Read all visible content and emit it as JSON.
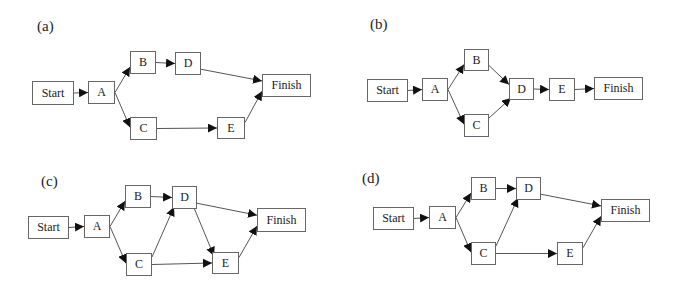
{
  "diagrams": [
    {
      "label": "(a)",
      "label_pos": [
        37,
        18
      ],
      "nodes": [
        {
          "id": "Start",
          "label": "Start",
          "x": 32,
          "y": 81,
          "w": 42,
          "h": 24
        },
        {
          "id": "A",
          "label": "A",
          "x": 88,
          "y": 81,
          "w": 27,
          "h": 23
        },
        {
          "id": "B",
          "label": "B",
          "x": 130,
          "y": 51,
          "w": 26,
          "h": 23
        },
        {
          "id": "D",
          "label": "D",
          "x": 175,
          "y": 52,
          "w": 26,
          "h": 23
        },
        {
          "id": "C",
          "label": "C",
          "x": 130,
          "y": 117,
          "w": 27,
          "h": 23
        },
        {
          "id": "E",
          "label": "E",
          "x": 217,
          "y": 117,
          "w": 28,
          "h": 22
        },
        {
          "id": "Finish",
          "label": "Finish",
          "x": 262,
          "y": 74,
          "w": 49,
          "h": 23
        }
      ],
      "edges": [
        [
          "Start",
          "A"
        ],
        [
          "A",
          "B"
        ],
        [
          "A",
          "C"
        ],
        [
          "B",
          "D"
        ],
        [
          "C",
          "E"
        ],
        [
          "D",
          "Finish"
        ],
        [
          "E",
          "Finish"
        ]
      ]
    },
    {
      "label": "(b)",
      "label_pos": [
        370,
        16
      ],
      "nodes": [
        {
          "id": "Start",
          "label": "Start",
          "x": 367,
          "y": 79,
          "w": 41,
          "h": 23
        },
        {
          "id": "A",
          "label": "A",
          "x": 422,
          "y": 78,
          "w": 26,
          "h": 23
        },
        {
          "id": "B",
          "label": "B",
          "x": 464,
          "y": 49,
          "w": 25,
          "h": 22
        },
        {
          "id": "C",
          "label": "C",
          "x": 464,
          "y": 114,
          "w": 25,
          "h": 23
        },
        {
          "id": "D",
          "label": "D",
          "x": 509,
          "y": 78,
          "w": 25,
          "h": 22
        },
        {
          "id": "E",
          "label": "E",
          "x": 549,
          "y": 78,
          "w": 26,
          "h": 23
        },
        {
          "id": "Finish",
          "label": "Finish",
          "x": 594,
          "y": 77,
          "w": 49,
          "h": 23
        }
      ],
      "edges": [
        [
          "Start",
          "A"
        ],
        [
          "A",
          "B"
        ],
        [
          "A",
          "C"
        ],
        [
          "B",
          "D"
        ],
        [
          "C",
          "D"
        ],
        [
          "D",
          "E"
        ],
        [
          "E",
          "Finish"
        ]
      ]
    },
    {
      "label": "(c)",
      "label_pos": [
        41,
        173
      ],
      "nodes": [
        {
          "id": "Start",
          "label": "Start",
          "x": 28,
          "y": 216,
          "w": 41,
          "h": 23
        },
        {
          "id": "A",
          "label": "A",
          "x": 84,
          "y": 215,
          "w": 26,
          "h": 23
        },
        {
          "id": "B",
          "label": "B",
          "x": 125,
          "y": 185,
          "w": 26,
          "h": 23
        },
        {
          "id": "D",
          "label": "D",
          "x": 172,
          "y": 186,
          "w": 25,
          "h": 23
        },
        {
          "id": "C",
          "label": "C",
          "x": 126,
          "y": 253,
          "w": 26,
          "h": 23
        },
        {
          "id": "E",
          "label": "E",
          "x": 212,
          "y": 252,
          "w": 27,
          "h": 22
        },
        {
          "id": "Finish",
          "label": "Finish",
          "x": 257,
          "y": 208,
          "w": 49,
          "h": 24
        }
      ],
      "edges": [
        [
          "Start",
          "A"
        ],
        [
          "A",
          "B"
        ],
        [
          "A",
          "C"
        ],
        [
          "B",
          "D"
        ],
        [
          "C",
          "D"
        ],
        [
          "C",
          "E"
        ],
        [
          "D",
          "E"
        ],
        [
          "D",
          "Finish"
        ],
        [
          "E",
          "Finish"
        ]
      ]
    },
    {
      "label": "(d)",
      "label_pos": [
        362,
        170
      ],
      "nodes": [
        {
          "id": "Start",
          "label": "Start",
          "x": 373,
          "y": 207,
          "w": 41,
          "h": 23
        },
        {
          "id": "A",
          "label": "A",
          "x": 429,
          "y": 206,
          "w": 27,
          "h": 23
        },
        {
          "id": "B",
          "label": "B",
          "x": 471,
          "y": 177,
          "w": 25,
          "h": 23
        },
        {
          "id": "D",
          "label": "D",
          "x": 516,
          "y": 177,
          "w": 25,
          "h": 23
        },
        {
          "id": "C",
          "label": "C",
          "x": 471,
          "y": 242,
          "w": 25,
          "h": 23
        },
        {
          "id": "E",
          "label": "E",
          "x": 557,
          "y": 242,
          "w": 26,
          "h": 23
        },
        {
          "id": "Finish",
          "label": "Finish",
          "x": 601,
          "y": 199,
          "w": 49,
          "h": 23
        }
      ],
      "edges": [
        [
          "Start",
          "A"
        ],
        [
          "A",
          "B"
        ],
        [
          "A",
          "C"
        ],
        [
          "B",
          "D"
        ],
        [
          "C",
          "D"
        ],
        [
          "C",
          "E"
        ],
        [
          "D",
          "Finish"
        ],
        [
          "E",
          "Finish"
        ]
      ]
    }
  ],
  "colors": {
    "line": "#555555",
    "border": "#666666",
    "text": "#222222"
  }
}
